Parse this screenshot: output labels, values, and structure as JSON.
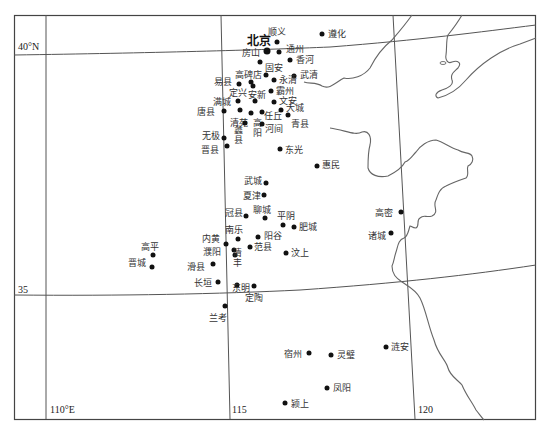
{
  "map": {
    "frame": {
      "x1": 14,
      "y1": 15,
      "x2": 536,
      "y2": 419
    },
    "axis_labels": {
      "lat_40": "40°N",
      "lat_35": "35",
      "lon_110": "110°E",
      "lon_115": "115",
      "lon_120": "120"
    },
    "capital": {
      "name": "北京",
      "x": 267,
      "y": 51
    },
    "places": [
      {
        "name": "顺义",
        "x": 277,
        "y": 42,
        "lx": 268,
        "ly": 27
      },
      {
        "name": "遵化",
        "x": 322,
        "y": 34,
        "lx": 328,
        "ly": 29
      },
      {
        "name": "通州",
        "x": 279,
        "y": 52,
        "lx": 286,
        "ly": 44
      },
      {
        "name": "房山",
        "x": 260,
        "y": 62,
        "lx": 242,
        "ly": 48
      },
      {
        "name": "香河",
        "x": 290,
        "y": 60,
        "lx": 296,
        "ly": 55
      },
      {
        "name": "固安",
        "x": 266,
        "y": 75,
        "lx": 265,
        "ly": 63
      },
      {
        "name": "武清",
        "x": 294,
        "y": 76,
        "lx": 300,
        "ly": 70
      },
      {
        "name": "高碑店",
        "x": 251,
        "y": 82,
        "lx": 235,
        "ly": 70
      },
      {
        "name": "易县",
        "x": 239,
        "y": 84,
        "lx": 214,
        "ly": 77
      },
      {
        "name": "永清",
        "x": 274,
        "y": 80,
        "lx": 279,
        "ly": 75
      },
      {
        "name": "定兴",
        "x": 253,
        "y": 86,
        "lx": 229,
        "ly": 88
      },
      {
        "name": "霸州",
        "x": 271,
        "y": 91,
        "lx": 276,
        "ly": 86
      },
      {
        "name": "安新",
        "x": 255,
        "y": 101,
        "lx": 248,
        "ly": 90
      },
      {
        "name": "满城",
        "x": 238,
        "y": 101,
        "lx": 213,
        "ly": 97
      },
      {
        "name": "文安",
        "x": 274,
        "y": 102,
        "lx": 279,
        "ly": 96
      },
      {
        "name": "唐县",
        "x": 224,
        "y": 111,
        "lx": 197,
        "ly": 107
      },
      {
        "name": "清苑",
        "x": 240,
        "y": 110,
        "lx": 230,
        "ly": 118
      },
      {
        "name": "高阳",
        "x": 251,
        "y": 113,
        "lx": 252,
        "ly": 118,
        "vertical": true
      },
      {
        "name": "任丘",
        "x": 262,
        "y": 112,
        "lx": 264,
        "ly": 111
      },
      {
        "name": "大城",
        "x": 281,
        "y": 110,
        "lx": 286,
        "ly": 103
      },
      {
        "name": "蠡县",
        "x": 245,
        "y": 123,
        "lx": 233,
        "ly": 125,
        "vertical": true
      },
      {
        "name": "河间",
        "x": 262,
        "y": 124,
        "lx": 265,
        "ly": 124
      },
      {
        "name": "青县",
        "x": 288,
        "y": 115,
        "lx": 291,
        "ly": 119
      },
      {
        "name": "无极",
        "x": 224,
        "y": 138,
        "lx": 202,
        "ly": 131
      },
      {
        "name": "晋县",
        "x": 227,
        "y": 146,
        "lx": 201,
        "ly": 145
      },
      {
        "name": "东光",
        "x": 280,
        "y": 149,
        "lx": 285,
        "ly": 145
      },
      {
        "name": "惠民",
        "x": 317,
        "y": 166,
        "lx": 322,
        "ly": 160
      },
      {
        "name": "武城",
        "x": 266,
        "y": 183,
        "lx": 244,
        "ly": 176
      },
      {
        "name": "夏津",
        "x": 264,
        "y": 195,
        "lx": 243,
        "ly": 191
      },
      {
        "name": "冠县",
        "x": 246,
        "y": 216,
        "lx": 225,
        "ly": 208
      },
      {
        "name": "聊城",
        "x": 265,
        "y": 218,
        "lx": 253,
        "ly": 205
      },
      {
        "name": "平阴",
        "x": 283,
        "y": 225,
        "lx": 277,
        "ly": 211
      },
      {
        "name": "肥城",
        "x": 294,
        "y": 227,
        "lx": 299,
        "ly": 222
      },
      {
        "name": "高密",
        "x": 401,
        "y": 212,
        "lx": 375,
        "ly": 208
      },
      {
        "name": "诸城",
        "x": 391,
        "y": 233,
        "lx": 368,
        "ly": 231
      },
      {
        "name": "南乐",
        "x": 238,
        "y": 239,
        "lx": 225,
        "ly": 225
      },
      {
        "name": "阳谷",
        "x": 258,
        "y": 237,
        "lx": 264,
        "ly": 231
      },
      {
        "name": "内黄",
        "x": 226,
        "y": 244,
        "lx": 202,
        "ly": 234
      },
      {
        "name": "高平",
        "x": 153,
        "y": 255,
        "lx": 141,
        "ly": 242
      },
      {
        "name": "范县",
        "x": 250,
        "y": 247,
        "lx": 254,
        "ly": 242
      },
      {
        "name": "濮阳",
        "x": 234,
        "y": 250,
        "lx": 203,
        "ly": 247
      },
      {
        "name": "清丰",
        "x": 235,
        "y": 255,
        "lx": 232,
        "ly": 248,
        "vertical": true
      },
      {
        "name": "汶上",
        "x": 286,
        "y": 253,
        "lx": 291,
        "ly": 248
      },
      {
        "name": "晋城",
        "x": 152,
        "y": 267,
        "lx": 128,
        "ly": 258
      },
      {
        "name": "滑县",
        "x": 213,
        "y": 264,
        "lx": 187,
        "ly": 262
      },
      {
        "name": "长垣",
        "x": 218,
        "y": 282,
        "lx": 194,
        "ly": 278
      },
      {
        "name": "东明",
        "x": 237,
        "y": 285,
        "lx": 232,
        "ly": 283
      },
      {
        "name": "定陶",
        "x": 254,
        "y": 286,
        "lx": 245,
        "ly": 293
      },
      {
        "name": "兰考",
        "x": 225,
        "y": 306,
        "lx": 209,
        "ly": 313
      },
      {
        "name": "宿州",
        "x": 309,
        "y": 353,
        "lx": 284,
        "ly": 349
      },
      {
        "name": "灵璧",
        "x": 331,
        "y": 355,
        "lx": 337,
        "ly": 350
      },
      {
        "name": "涟安",
        "x": 386,
        "y": 347,
        "lx": 391,
        "ly": 342
      },
      {
        "name": "凤阳",
        "x": 327,
        "y": 388,
        "lx": 333,
        "ly": 383
      },
      {
        "name": "颍上",
        "x": 285,
        "y": 403,
        "lx": 291,
        "ly": 399
      }
    ]
  }
}
